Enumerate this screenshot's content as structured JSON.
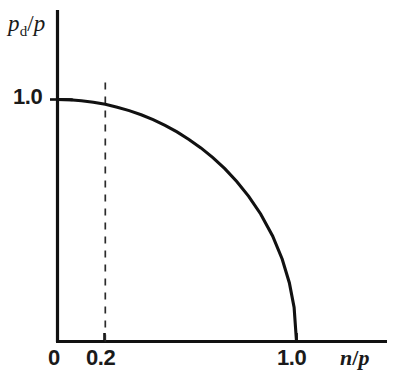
{
  "figure": {
    "background_color": "#ffffff",
    "ink_color": "#111111"
  },
  "axes": {
    "y_title_main": "p",
    "y_title_sub": "d",
    "y_title_slash": "/",
    "y_title_denom": "p",
    "y_title_text": "p_d/p",
    "x_title_num": "n",
    "x_title_slash": "/",
    "x_title_den": "p",
    "x_title_text": "n/p",
    "origin_label": "0",
    "x_ticks": [
      "0.2",
      "1.0"
    ],
    "y_ticks": [
      "1.0"
    ]
  },
  "annotations": {
    "dashed_guide_value": "0.2",
    "dashed_guide_style": "dashed-vertical"
  },
  "chart_data": {
    "type": "line",
    "title": "",
    "xlabel": "n/p",
    "ylabel": "p_d/p",
    "xlim": [
      0,
      1.25
    ],
    "ylim": [
      0,
      1.2
    ],
    "grid": false,
    "legend": null,
    "series": [
      {
        "name": "pd/p vs n/p (quarter ellipse)",
        "style": "solid",
        "x": [
          0.0,
          0.05,
          0.1,
          0.15,
          0.2,
          0.25,
          0.3,
          0.35,
          0.4,
          0.45,
          0.5,
          0.55,
          0.6,
          0.65,
          0.7,
          0.75,
          0.8,
          0.85,
          0.9,
          0.94,
          0.97,
          0.99,
          1.0
        ],
        "y": [
          1.0,
          0.999,
          0.995,
          0.989,
          0.98,
          0.968,
          0.954,
          0.937,
          0.917,
          0.893,
          0.866,
          0.835,
          0.8,
          0.76,
          0.714,
          0.661,
          0.6,
          0.527,
          0.436,
          0.341,
          0.243,
          0.141,
          0.0
        ]
      },
      {
        "name": "guide line at n/p = 0.2",
        "style": "dashed",
        "x": [
          0.2,
          0.2
        ],
        "y": [
          0.0,
          1.07
        ]
      }
    ],
    "x_tick_values": [
      0,
      0.2,
      1.0
    ],
    "x_tick_labels": [
      "0",
      "0.2",
      "1.0"
    ],
    "y_tick_values": [
      1.0
    ],
    "y_tick_labels": [
      "1.0"
    ],
    "annotations": [
      {
        "text": "0.2",
        "kind": "x-tick-with-dashed-guide"
      }
    ]
  }
}
